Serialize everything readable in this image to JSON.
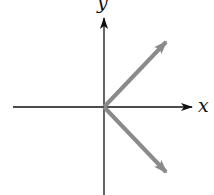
{
  "diagram": {
    "type": "coordinate-axes-with-vectors",
    "axes": {
      "x": {
        "label": "x",
        "color": "#111111"
      },
      "y": {
        "label": "y",
        "color": "#111111"
      }
    },
    "origin_px": [
      104,
      107
    ],
    "vectors": [
      {
        "name": "vector-up-right",
        "from": [
          104,
          107
        ],
        "to": [
          166,
          42
        ],
        "color": "#8a8a8a",
        "direction_deg": 45
      },
      {
        "name": "vector-down-right",
        "from": [
          104,
          107
        ],
        "to": [
          166,
          172
        ],
        "color": "#8a8a8a",
        "direction_deg": -45
      }
    ]
  }
}
